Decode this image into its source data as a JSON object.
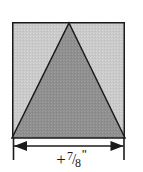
{
  "figure": {
    "background_color": "#ffffff",
    "square": {
      "name": "outer-square",
      "fill_color": "#c9c9c9",
      "stroke_color": "#1b1b1b",
      "stroke_width": 1.5,
      "x": 12,
      "y": 22,
      "width": 113,
      "height": 116
    },
    "triangle": {
      "name": "inscribed-triangle",
      "fill_color": "#8f8f8f",
      "stroke_color": "#1b1b1b",
      "stroke_width": 1.5,
      "apex_x": 69,
      "apex_y": 22,
      "base_left_x": 12,
      "base_right_x": 125,
      "base_y": 138
    },
    "dimension": {
      "name": "width-dimension",
      "line_color": "#1b1b1b",
      "line_y": 146,
      "left_x": 13,
      "right_x": 124,
      "extension_top_y": 137,
      "extension_bottom_y": 160,
      "arrow_length": 13,
      "arrow_half_height": 5
    }
  },
  "label": {
    "plus": "+",
    "numerator": "7",
    "solidus": "/",
    "denominator": "8",
    "inch_mark": "\"",
    "full_text": "+7/8\""
  }
}
